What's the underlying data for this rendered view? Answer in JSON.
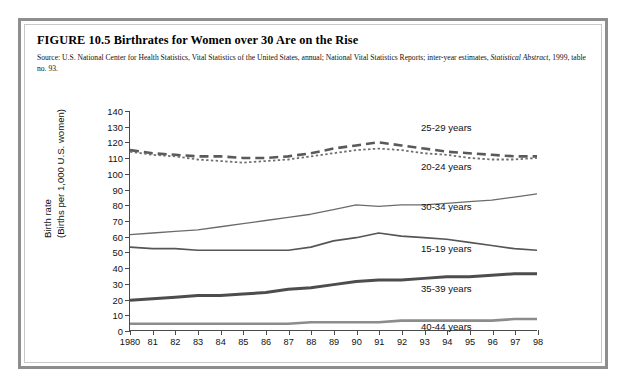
{
  "figure": {
    "title": "FIGURE 10.5  Birthrates for Women over 30 Are on the Rise",
    "source_line1": "Source: U.S. National Center for Health Statistics, Vital Statistics of the United States, annual; National Vital Statistics Reports; inter-year estimates, ",
    "source_italic": "Statistical Abstract",
    "source_line2": ", 1999, table no. 93."
  },
  "axis": {
    "y_title_line1": "Birth rate",
    "y_title_line2": "(Births per 1,000 U.S. women)"
  },
  "chart_data": {
    "type": "line",
    "title": "Birthrates for Women over 30 Are on the Rise",
    "xlabel": "",
    "ylabel": "Birth rate (Births per 1,000 U.S. women)",
    "ylim": [
      0,
      140
    ],
    "ytick_labels": [
      "0",
      "10",
      "20",
      "30",
      "40",
      "50",
      "60",
      "70",
      "80",
      "90",
      "100",
      "110",
      "120",
      "130",
      "140"
    ],
    "ytick_values": [
      0,
      10,
      20,
      30,
      40,
      50,
      60,
      70,
      80,
      90,
      100,
      110,
      120,
      130,
      140
    ],
    "grid": false,
    "legend_position": "inline-right-annotations",
    "x": [
      1980,
      1981,
      1982,
      1983,
      1984,
      1985,
      1986,
      1987,
      1988,
      1989,
      1990,
      1991,
      1992,
      1993,
      1994,
      1995,
      1996,
      1997,
      1998
    ],
    "xtick_labels": [
      "1980",
      "81",
      "82",
      "83",
      "84",
      "85",
      "86",
      "87",
      "88",
      "89",
      "90",
      "91",
      "92",
      "93",
      "94",
      "95",
      "96",
      "97",
      "98"
    ],
    "series": [
      {
        "name": "25-29 years",
        "label": "25-29 years",
        "style": "dashed",
        "color": "#5a5a5a",
        "width": 2.6,
        "values": [
          115,
          113,
          112,
          111,
          111,
          110,
          110,
          111,
          113,
          116,
          118,
          120,
          118,
          116,
          114,
          113,
          112,
          111,
          111
        ]
      },
      {
        "name": "20-24 years",
        "label": "20-24 years",
        "style": "dotted",
        "color": "#6e6e6e",
        "width": 1.8,
        "values": [
          114,
          112,
          111,
          109,
          108,
          107,
          108,
          109,
          111,
          113,
          115,
          116,
          115,
          113,
          112,
          110,
          109,
          109,
          110
        ]
      },
      {
        "name": "30-34 years",
        "label": "30-34 years",
        "style": "solid",
        "color": "#6b6b6b",
        "width": 1.3,
        "values": [
          61,
          62,
          63,
          64,
          66,
          68,
          70,
          72,
          74,
          77,
          80,
          79,
          80,
          80,
          81,
          82,
          83,
          85,
          87
        ]
      },
      {
        "name": "15-19 years",
        "label": "15-19 years",
        "style": "solid",
        "color": "#565656",
        "width": 1.7,
        "values": [
          53,
          52,
          52,
          51,
          51,
          51,
          51,
          51,
          53,
          57,
          59,
          62,
          60,
          59,
          58,
          56,
          54,
          52,
          51
        ]
      },
      {
        "name": "35-39 years",
        "label": "35-39 years",
        "style": "solid",
        "color": "#4d4d4d",
        "width": 3.0,
        "values": [
          19,
          20,
          21,
          22,
          22,
          23,
          24,
          26,
          27,
          29,
          31,
          32,
          32,
          33,
          34,
          34,
          35,
          36,
          36
        ]
      },
      {
        "name": "40-44 years",
        "label": "40-44 years",
        "style": "solid",
        "color": "#8c8c8c",
        "width": 2.6,
        "values": [
          4,
          4,
          4,
          4,
          4,
          4,
          4,
          4,
          5,
          5,
          5,
          5,
          6,
          6,
          6,
          6,
          6,
          7,
          7
        ]
      }
    ],
    "annotations": [
      {
        "text": "25-29 years",
        "x_pct": 71.5,
        "y_pct": 5
      },
      {
        "text": "20-24 years",
        "x_pct": 71.5,
        "y_pct": 23
      },
      {
        "text": "30-34 years",
        "x_pct": 71.5,
        "y_pct": 41
      },
      {
        "text": "15-19 years",
        "x_pct": 71.5,
        "y_pct": 60.5
      },
      {
        "text": "35-39 years",
        "x_pct": 71.5,
        "y_pct": 78.5
      },
      {
        "text": "40-44 years",
        "x_pct": 71.5,
        "y_pct": 96
      }
    ]
  }
}
